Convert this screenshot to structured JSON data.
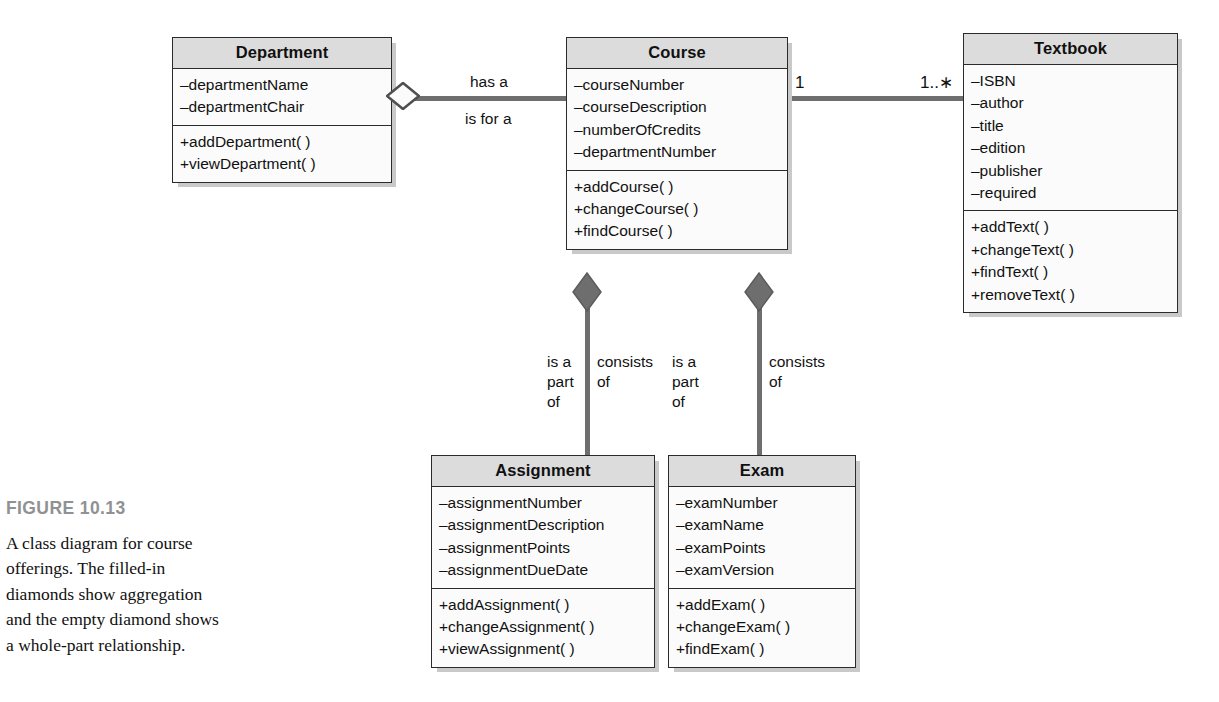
{
  "figure": {
    "number": "FIGURE 10.13",
    "caption": "A class diagram for course offerings. The filled-in diamonds show aggregation and the empty diamond shows a whole-part relationship."
  },
  "diagram": {
    "type": "uml-class-diagram",
    "classes": [
      {
        "id": "department",
        "name": "Department",
        "attributes": [
          "–departmentName",
          "–departmentChair"
        ],
        "operations": [
          "+addDepartment( )",
          "+viewDepartment( )"
        ]
      },
      {
        "id": "course",
        "name": "Course",
        "attributes": [
          "–courseNumber",
          "–courseDescription",
          "–numberOfCredits",
          "–departmentNumber"
        ],
        "operations": [
          "+addCourse( )",
          "+changeCourse( )",
          "+findCourse( )"
        ]
      },
      {
        "id": "textbook",
        "name": "Textbook",
        "attributes": [
          "–ISBN",
          "–author",
          "–title",
          "–edition",
          "–publisher",
          "–required"
        ],
        "operations": [
          "+addText( )",
          "+changeText( )",
          "+findText( )",
          "+removeText( )"
        ]
      },
      {
        "id": "assignment",
        "name": "Assignment",
        "attributes": [
          "–assignmentNumber",
          "–assignmentDescription",
          "–assignmentPoints",
          "–assignmentDueDate"
        ],
        "operations": [
          "+addAssignment( )",
          "+changeAssignment( )",
          "+viewAssignment( )"
        ]
      },
      {
        "id": "exam",
        "name": "Exam",
        "attributes": [
          "–examNumber",
          "–examName",
          "–examPoints",
          "–examVersion"
        ],
        "operations": [
          "+addExam( )",
          "+changeExam( )",
          "+findExam( )"
        ]
      }
    ],
    "relationships": [
      {
        "id": "department-course",
        "from": "department",
        "to": "course",
        "kind": "aggregation-open-diamond",
        "label_upper": "has a",
        "label_lower": "is for a",
        "from_multiplicity": "",
        "to_multiplicity": ""
      },
      {
        "id": "course-textbook",
        "from": "course",
        "to": "textbook",
        "kind": "association",
        "from_multiplicity": "1",
        "to_multiplicity": "1..∗"
      },
      {
        "id": "course-assignment",
        "from": "course",
        "to": "assignment",
        "kind": "aggregation-filled-diamond",
        "label_left": "is a\npart\nof",
        "label_right": "consists\nof"
      },
      {
        "id": "course-exam",
        "from": "course",
        "to": "exam",
        "kind": "aggregation-filled-diamond",
        "label_left": "is a\npart\nof",
        "label_right": "consists\nof"
      }
    ]
  },
  "colors": {
    "header_fill": "#dcdcdc",
    "body_fill": "#fbfbfb",
    "border": "#2b2b2b",
    "connector": "#6e6e6e",
    "diamond_fill": "#6e6e6e",
    "shadow": "#c9c9c9",
    "figure_label": "#8f9193",
    "text": "#111111"
  }
}
